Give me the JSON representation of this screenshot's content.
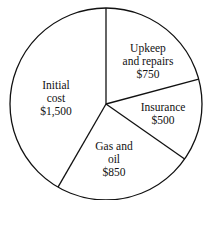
{
  "chart_data": {
    "type": "pie",
    "title": "",
    "start_angle_deg": 0,
    "direction": "clockwise",
    "categories": [
      "Upkeep and repairs",
      "Insurance",
      "Gas and oil",
      "Initial cost"
    ],
    "values": [
      750,
      500,
      850,
      1500
    ],
    "value_labels": [
      "$750",
      "$500",
      "$850",
      "$1,500"
    ],
    "label_lines": [
      [
        "Upkeep",
        "and repairs",
        "$750"
      ],
      [
        "Insurance",
        "$500"
      ],
      [
        "Gas and",
        "oil",
        "$850"
      ],
      [
        "Initial",
        "cost",
        "$1,500"
      ]
    ],
    "colors": {
      "fill": "#ffffff",
      "stroke": "#111111"
    }
  }
}
